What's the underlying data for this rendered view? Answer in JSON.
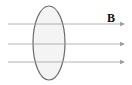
{
  "diagram": {
    "title": "",
    "field_label": "B",
    "loop": {
      "cx": 49,
      "cy": 43,
      "rx": 16,
      "ry": 37,
      "stroke": "#6a6a6a",
      "fill": "#f4f4f4"
    },
    "field_lines": [
      {
        "y": 24,
        "x1": 8,
        "x2": 124
      },
      {
        "y": 44,
        "x1": 8,
        "x2": 124
      },
      {
        "y": 62,
        "x1": 8,
        "x2": 124
      }
    ],
    "line_color": "#a0a0a0"
  }
}
